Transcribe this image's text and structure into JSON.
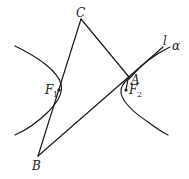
{
  "diagram": {
    "type": "hyperbola-geometry",
    "colors": {
      "stroke": "#1a1a1a",
      "background": "#ffffff"
    },
    "points": {
      "C": {
        "label": "C"
      },
      "B": {
        "label": "B"
      },
      "A": {
        "label": "A"
      },
      "F1": {
        "label": "F",
        "subscript": "1"
      },
      "F2": {
        "label": "F",
        "subscript": "2"
      }
    },
    "lines": {
      "l": {
        "label": "l"
      },
      "alpha": {
        "label": "α"
      }
    }
  }
}
